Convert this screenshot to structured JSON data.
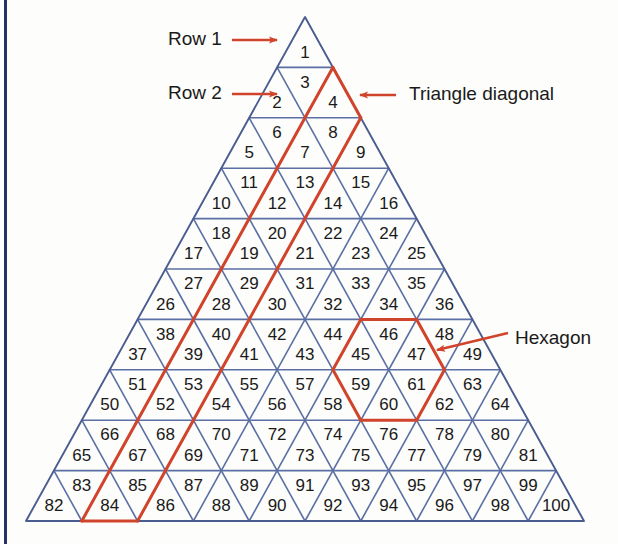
{
  "figure": {
    "grid": {
      "rows": 10,
      "total_cells": 100,
      "apex": {
        "x": 305,
        "y": 17
      },
      "bottom_left": {
        "x": 26,
        "y": 521
      },
      "bottom_right": {
        "x": 584,
        "y": 521
      },
      "row_height": 50.4,
      "cell_numbers": [
        [
          1
        ],
        [
          2,
          3,
          4
        ],
        [
          5,
          6,
          7,
          8,
          9
        ],
        [
          10,
          11,
          12,
          13,
          14,
          15,
          16
        ],
        [
          17,
          18,
          19,
          20,
          21,
          22,
          23,
          24,
          25
        ],
        [
          26,
          27,
          28,
          29,
          30,
          31,
          32,
          33,
          34,
          35,
          36
        ],
        [
          37,
          38,
          39,
          40,
          41,
          42,
          43,
          44,
          45,
          46,
          47,
          48,
          49
        ],
        [
          50,
          51,
          52,
          53,
          54,
          55,
          56,
          57,
          58,
          59,
          60,
          61,
          62,
          63,
          64
        ],
        [
          65,
          66,
          67,
          68,
          69,
          70,
          71,
          72,
          73,
          74,
          75,
          76,
          77,
          78,
          79,
          80,
          81
        ],
        [
          82,
          83,
          84,
          85,
          86,
          87,
          88,
          89,
          90,
          91,
          92,
          93,
          94,
          95,
          96,
          97,
          98,
          99,
          100
        ]
      ]
    },
    "colors": {
      "grid_line": "#5a6fa3",
      "outline": "#4a5c90",
      "highlight": "#d1442c",
      "annotation_text": "#1a1a1a",
      "left_rule": "#2b2f62",
      "background": "#fdfdfb"
    },
    "annotations": [
      {
        "id": "row-1",
        "label": "Row 1",
        "text_x": 168,
        "text_y": 40,
        "arrow_from": {
          "x": 232,
          "y": 40
        },
        "arrow_to": {
          "x": 277,
          "y": 40
        }
      },
      {
        "id": "row-2",
        "label": "Row 2",
        "text_x": 168,
        "text_y": 94,
        "arrow_from": {
          "x": 232,
          "y": 94
        },
        "arrow_to": {
          "x": 277,
          "y": 94
        }
      },
      {
        "id": "triangle-diagonal",
        "label": "Triangle diagonal",
        "text_x": 409,
        "text_y": 95,
        "arrow_from": {
          "x": 396,
          "y": 95
        },
        "arrow_to": {
          "x": 360,
          "y": 95
        }
      },
      {
        "id": "hexagon",
        "label": "Hexagon",
        "text_x": 515,
        "text_y": 339,
        "arrow_from": {
          "x": 508,
          "y": 333
        },
        "arrow_to": {
          "x": 437,
          "y": 350
        }
      }
    ],
    "highlights": {
      "triangle_diagonal": {
        "name": "Triangle diagonal",
        "cells": [
          4,
          7,
          8,
          12,
          13,
          19,
          20,
          28,
          29,
          39,
          40,
          52,
          53,
          67,
          68,
          84,
          85
        ]
      },
      "hexagon": {
        "name": "Hexagon",
        "cells": [
          45,
          46,
          47,
          59,
          60,
          61
        ],
        "center_row": 7,
        "center_index": 8
      }
    }
  }
}
